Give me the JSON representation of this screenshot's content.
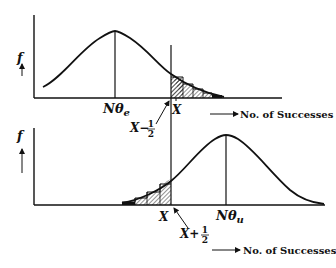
{
  "diagram": {
    "top_panel": {
      "y_label": "f",
      "mean_label_base": "Nθ",
      "mean_label_sub": "e",
      "x_mark_label": "X",
      "pointer_label": "X−",
      "pointer_fraction_num": "1",
      "pointer_fraction_den": "2",
      "axis_caption": "No. of Successes",
      "shaded_region": "upper tail beyond X−½"
    },
    "bottom_panel": {
      "y_label": "f",
      "mean_label_base": "Nθ",
      "mean_label_sub": "u",
      "x_mark_label": "X",
      "pointer_label": "X+",
      "pointer_fraction_num": "1",
      "pointer_fraction_den": "2",
      "axis_caption": "No. of Successes",
      "shaded_region": "lower tail below X+½"
    },
    "colors": {
      "ink": "#111111",
      "background": "#ffffff"
    }
  }
}
